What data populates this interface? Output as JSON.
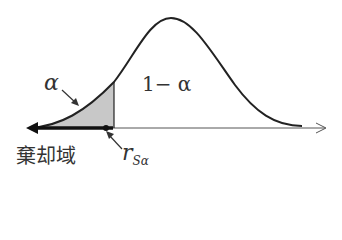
{
  "diagram": {
    "title": "",
    "labels": {
      "alpha": "α",
      "one_minus_alpha": "1− α",
      "rejection_region": "棄却域",
      "critical_value_main": "r",
      "critical_value_sub": "Sα"
    },
    "colors": {
      "curve": "#222222",
      "shade": "#c8c8c8",
      "axis": "#444444",
      "text": "#333333"
    }
  }
}
